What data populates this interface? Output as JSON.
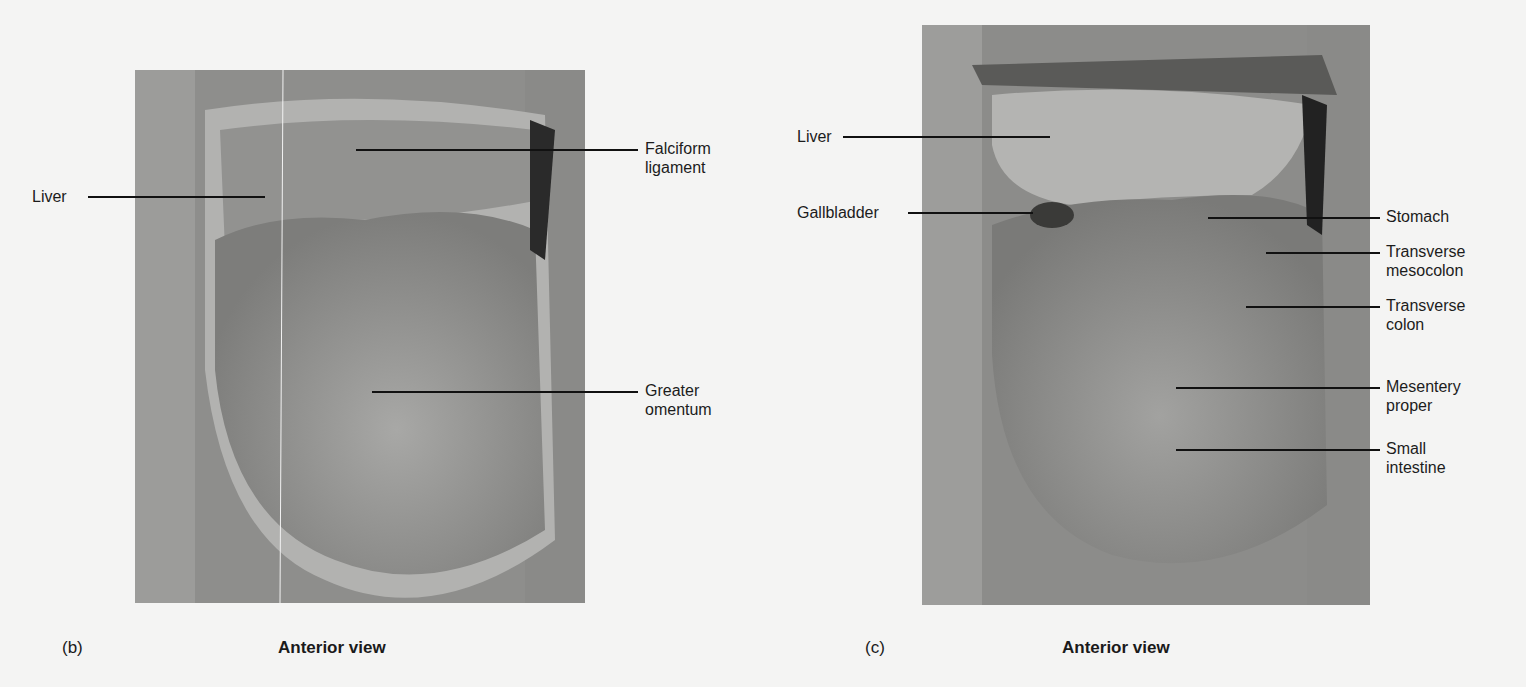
{
  "panels": [
    {
      "id": "b",
      "letter": "(b)",
      "view": "Anterior view",
      "labels": {
        "liver": "Liver",
        "falciform_1": "Falciform",
        "falciform_2": "ligament",
        "omentum_1": "Greater",
        "omentum_2": "omentum"
      }
    },
    {
      "id": "c",
      "letter": "(c)",
      "view": "Anterior view",
      "labels": {
        "liver": "Liver",
        "gallbladder": "Gallbladder",
        "stomach": "Stomach",
        "tmeso_1": "Transverse",
        "tmeso_2": "mesocolon",
        "tcolon_1": "Transverse",
        "tcolon_2": "colon",
        "mesentery_1": "Mesentery",
        "mesentery_2": "proper",
        "small_1": "Small",
        "small_2": "intestine"
      }
    }
  ]
}
